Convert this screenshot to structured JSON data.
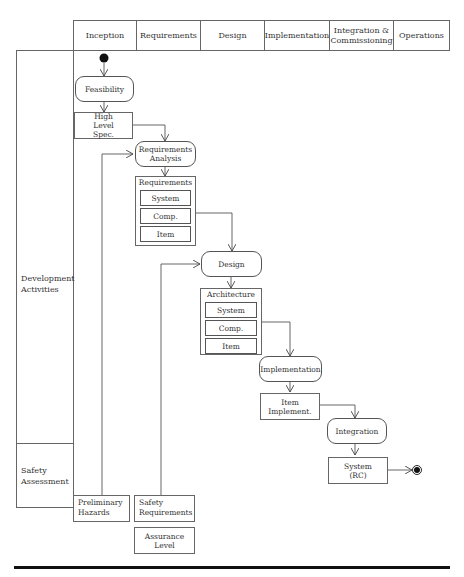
{
  "header": {
    "phases": [
      "Inception",
      "Requirements",
      "Design",
      "Implementation",
      "Integration & Commissioning",
      "Operations"
    ]
  },
  "lanes": {
    "development": "Development Activities",
    "safety": "Safety Assessment"
  },
  "activities": {
    "feasibility": "Feasibility",
    "requirements_analysis": "Requirements Analysis",
    "design": "Design",
    "implementation": "Implementation",
    "integration": "Integration"
  },
  "artifacts": {
    "high_level_spec": "High Level Spec.",
    "requirements": {
      "title": "Requirements",
      "items": [
        "System",
        "Comp.",
        "Item"
      ]
    },
    "architecture": {
      "title": "Architecture",
      "items": [
        "System",
        "Comp.",
        "Item"
      ]
    },
    "item_implement": "Item Implement.",
    "system_rc": "System (RC)"
  },
  "safety": {
    "preliminary_hazards": "Preliminary Hazards",
    "safety_requirements": "Safety Requirements",
    "assurance_level": "Assurance Level"
  },
  "colors": {
    "line": "#555555",
    "node": "#111111"
  }
}
